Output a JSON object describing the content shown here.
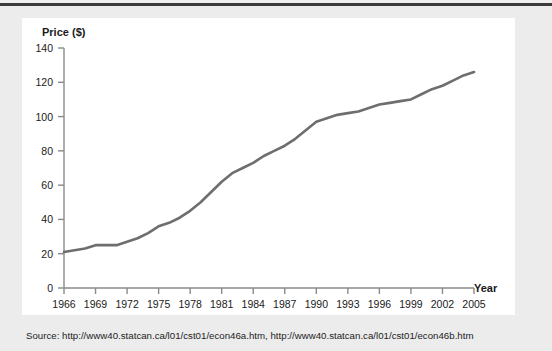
{
  "page": {
    "source_caption": "Source: http://www40.statcan.ca/l01/cst01/econ46a.htm, http://www40.statcan.ca/l01/cst01/econ46b.htm"
  },
  "chart_data": {
    "type": "line",
    "title": "",
    "subtitle": "",
    "xlabel": "Year",
    "ylabel": "Price ($)",
    "xlim": [
      1966,
      2005
    ],
    "ylim": [
      0,
      140
    ],
    "grid": false,
    "legend": null,
    "line_color": "#6e6e6e",
    "axis_color": "#8a8a8a",
    "text_color": "#1a1a1a",
    "ytick_labels": [
      "0",
      "20",
      "40",
      "60",
      "80",
      "100",
      "120",
      "140"
    ],
    "yticks": [
      0,
      20,
      40,
      60,
      80,
      100,
      120,
      140
    ],
    "xtick_labels": [
      "1966",
      "1969",
      "1972",
      "1975",
      "1978",
      "1981",
      "1984",
      "1987",
      "1990",
      "1993",
      "1996",
      "1999",
      "2002",
      "2005"
    ],
    "xticks": [
      1966,
      1969,
      1972,
      1975,
      1978,
      1981,
      1984,
      1987,
      1990,
      1993,
      1996,
      1999,
      2002,
      2005
    ],
    "series": [
      {
        "name": "Price",
        "x": [
          1966,
          1967,
          1968,
          1969,
          1970,
          1971,
          1972,
          1973,
          1974,
          1975,
          1976,
          1977,
          1978,
          1979,
          1980,
          1981,
          1982,
          1983,
          1984,
          1985,
          1986,
          1987,
          1988,
          1989,
          1990,
          1991,
          1992,
          1993,
          1994,
          1995,
          1996,
          1997,
          1998,
          1999,
          2000,
          2001,
          2002,
          2003,
          2004,
          2005
        ],
        "values": [
          21,
          22,
          23,
          25,
          25,
          25,
          27,
          29,
          32,
          36,
          38,
          41,
          45,
          50,
          56,
          62,
          67,
          70,
          73,
          77,
          80,
          83,
          87,
          92,
          97,
          99,
          101,
          102,
          103,
          105,
          107,
          108,
          109,
          110,
          113,
          116,
          118,
          121,
          124,
          126
        ]
      }
    ]
  }
}
